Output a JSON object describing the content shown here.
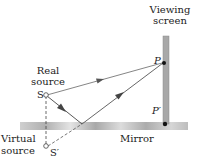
{
  "labels": {
    "viewing_line1": "Viewing",
    "viewing_line2": "screen",
    "real_line1": "Real",
    "real_line2": "source",
    "S": "S",
    "P": "P",
    "P_prime": "P′",
    "virtual_line1": "Virtual",
    "virtual_line2": "source",
    "S_prime": "S′",
    "mirror": "Mirror"
  },
  "colors": {
    "ray": "#555555",
    "mirror": "#b5b5b5",
    "screen": "#a8a8a8",
    "text": "#222222"
  }
}
